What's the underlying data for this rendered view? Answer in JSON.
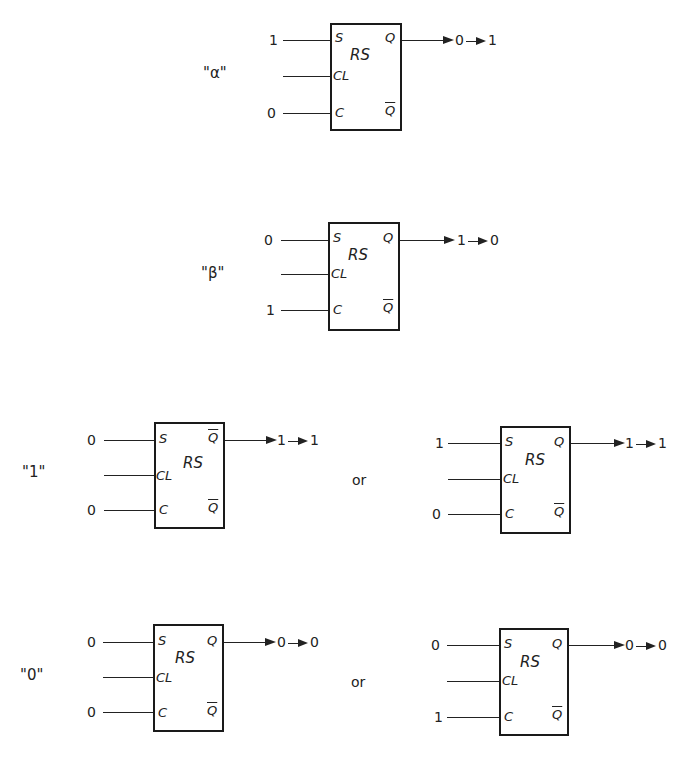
{
  "figure": {
    "block_label": "RS",
    "pins": {
      "set": "S",
      "clock": "CL",
      "clear": "C",
      "q": "Q",
      "q_bar": "Q"
    },
    "cases": [
      {
        "id": "alpha",
        "label": "\"α\"",
        "inputs": {
          "S": "1",
          "CL": "",
          "C": "0"
        },
        "output_pin": "Q",
        "output_pin_barred": false,
        "bottom_pin_barred": true,
        "output_transition": [
          "0",
          "1"
        ]
      },
      {
        "id": "beta",
        "label": "\"β\"",
        "inputs": {
          "S": "0",
          "CL": "",
          "C": "1"
        },
        "output_pin": "Q",
        "output_pin_barred": false,
        "bottom_pin_barred": true,
        "output_transition": [
          "1",
          "0"
        ]
      },
      {
        "id": "one-a",
        "label": "\"1\"",
        "inputs": {
          "S": "0",
          "CL": "",
          "C": "0"
        },
        "output_pin": "Q",
        "output_pin_barred": true,
        "bottom_pin_barred": true,
        "output_transition": [
          "1",
          "1"
        ]
      },
      {
        "id": "one-b",
        "label": "",
        "inputs": {
          "S": "1",
          "CL": "",
          "C": "0"
        },
        "output_pin": "Q",
        "output_pin_barred": false,
        "bottom_pin_barred": true,
        "output_transition": [
          "1",
          "1"
        ]
      },
      {
        "id": "zero-a",
        "label": "\"0\"",
        "inputs": {
          "S": "0",
          "CL": "",
          "C": "0"
        },
        "output_pin": "Q",
        "output_pin_barred": false,
        "bottom_pin_barred": true,
        "output_transition": [
          "0",
          "0"
        ]
      },
      {
        "id": "zero-b",
        "label": "",
        "inputs": {
          "S": "0",
          "CL": "",
          "C": "1"
        },
        "output_pin": "Q",
        "output_pin_barred": false,
        "bottom_pin_barred": true,
        "output_transition": [
          "0",
          "0"
        ]
      }
    ],
    "connectors": {
      "or_1": "or",
      "or_0": "or"
    }
  }
}
